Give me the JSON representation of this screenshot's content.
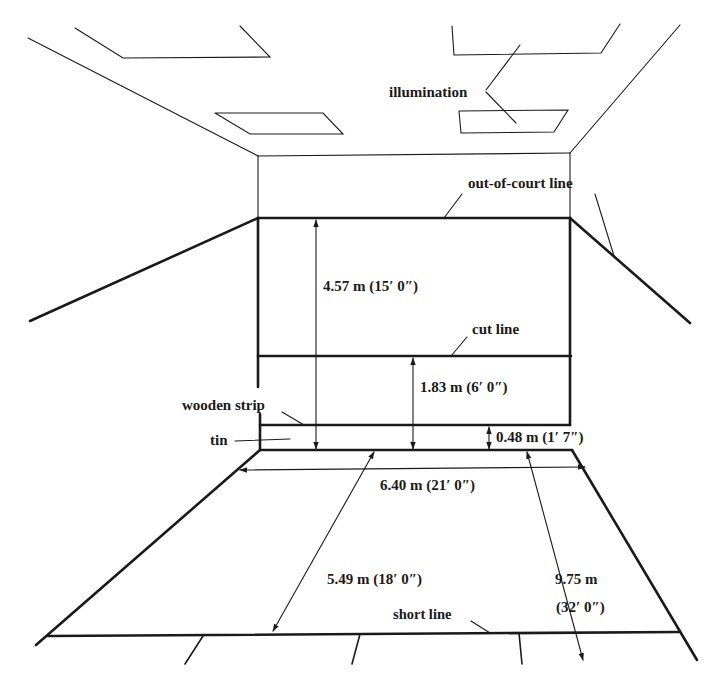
{
  "diagram": {
    "labels": {
      "illumination": "illumination",
      "out_of_court_line": "out-of-court line",
      "cut_line": "cut line",
      "wooden_strip": "wooden strip",
      "tin": "tin",
      "short_line": "short line"
    },
    "dimensions": {
      "out_of_court_height": "4.57 m (15′ 0″)",
      "cut_line_height": "1.83 m (6′ 0″)",
      "tin_height": "0.48 m (1′ 7″)",
      "court_width": "6.40 m (21′ 0″)",
      "short_line_distance": "5.49 m (18′ 0″)",
      "half_court_length_m": "9.75 m",
      "half_court_length_ft": "(32′ 0″)"
    }
  }
}
